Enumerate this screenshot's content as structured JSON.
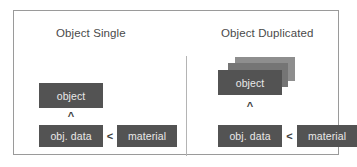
{
  "figure": {
    "panels": [
      {
        "id": "object-single",
        "title": "Object Single",
        "object_label": "object",
        "link_glyph": "^",
        "obj_data_label": "obj. data",
        "relation_glyph": "<",
        "material_label": "material",
        "duplicate_count": 1
      },
      {
        "id": "object-duplicated",
        "title": "Object Duplicated",
        "object_label": "object",
        "link_glyph": "^",
        "obj_data_label": "obj. data",
        "relation_glyph": "<",
        "material_label": "material",
        "duplicate_count": 3
      }
    ]
  },
  "colors": {
    "node_fill": "#535353",
    "node_text": "#e9e9e9",
    "ghost_back": "#8e8e8e",
    "ghost_mid": "#757575",
    "frame_border": "#9a9a9a",
    "divider": "#b4b4b4",
    "title_text": "#4a4a4a",
    "background": "#ffffff"
  }
}
